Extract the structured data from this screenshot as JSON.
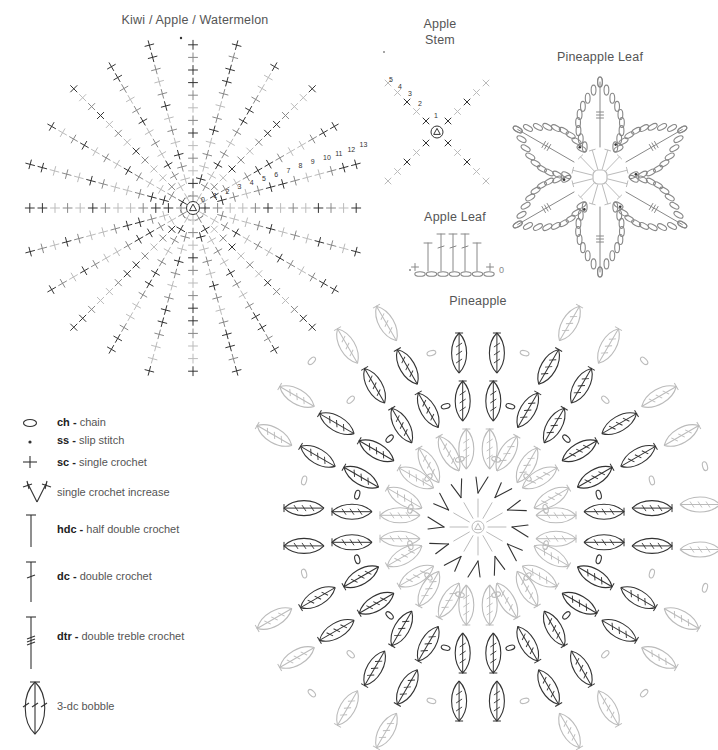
{
  "titles": {
    "kiwi": "Kiwi / Apple / Watermelon",
    "apple_stem_line1": "Apple",
    "apple_stem_line2": "Stem",
    "pineapple_leaf": "Pineapple Leaf",
    "apple_leaf": "Apple Leaf",
    "pineapple": "Pineapple"
  },
  "kiwi_round_numbers": [
    "0",
    "1",
    "2",
    "3",
    "4",
    "5",
    "6",
    "7",
    "8",
    "9",
    "10",
    "11",
    "12",
    "13"
  ],
  "apple_stem_round_numbers": [
    "1",
    "2",
    "3",
    "4",
    "5"
  ],
  "apple_leaf_end_label": "0",
  "legend": [
    {
      "icon": "chain-oval-icon",
      "abbr": "ch",
      "sep": " - ",
      "name": "chain"
    },
    {
      "icon": "slip-stitch-dot-icon",
      "abbr": "ss",
      "sep": " - ",
      "name": "slip stitch"
    },
    {
      "icon": "single-crochet-plus-icon",
      "abbr": "sc",
      "sep": " - ",
      "name": "single crochet"
    },
    {
      "icon": "sc-increase-v-icon",
      "abbr": "",
      "sep": "",
      "name": "single crochet increase"
    },
    {
      "icon": "hdc-t-icon",
      "abbr": "hdc",
      "sep": " - ",
      "name": "half double crochet"
    },
    {
      "icon": "dc-icon",
      "abbr": "dc",
      "sep": " - ",
      "name": "double crochet"
    },
    {
      "icon": "dtr-icon",
      "abbr": "dtr",
      "sep": " - ",
      "name": "double treble crochet"
    },
    {
      "icon": "bobble-icon",
      "abbr": "",
      "sep": "",
      "name": "3-dc bobble"
    }
  ],
  "colors": {
    "dark": "#333333",
    "mid": "#888888",
    "light": "#bbbbbb",
    "text": "#555555"
  }
}
